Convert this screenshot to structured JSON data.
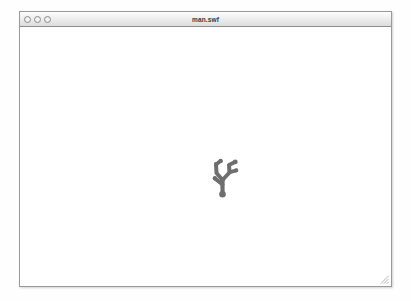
{
  "window": {
    "title": "man.swf",
    "controls": [
      {
        "name": "close",
        "label": ""
      },
      {
        "name": "minimize",
        "label": ""
      },
      {
        "name": "zoom",
        "label": ""
      }
    ]
  },
  "content": {
    "figure": {
      "icon": "branching-stick-figure",
      "color": "#6e6e6e",
      "description": ""
    }
  },
  "colors": {
    "window_border": "#9a9a9a",
    "titlebar_top": "#fdfdfd",
    "titlebar_bottom": "#dcdcdc",
    "content_background": "#ffffff",
    "figure": "#6e6e6e",
    "desktop": "#fefefe"
  }
}
